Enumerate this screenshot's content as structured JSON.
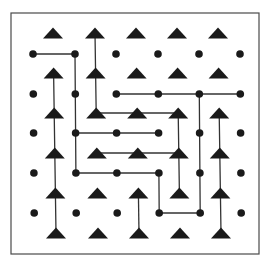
{
  "diagram": {
    "type": "dot-and-triangle lattice maze",
    "frame": {
      "x1": 11,
      "y1": 13,
      "x2": 259,
      "y2": 254,
      "color": "#4a4a4a"
    },
    "ink_color": "#1a1a1a",
    "line_color": "#333333",
    "triangle_grid": {
      "cols_x": [
        53,
        95,
        136,
        177,
        218
      ],
      "rows_y": [
        33,
        73,
        113,
        153,
        193,
        233
      ],
      "x_drift_per_row": 0.6
    },
    "dot_grid": {
      "cols_x": [
        33,
        75,
        116,
        158,
        199,
        240
      ],
      "rows_y": [
        54,
        94,
        133,
        173,
        213
      ],
      "x_drift_per_row": 0.3
    },
    "dot_paths": [
      [
        [
          0,
          0
        ],
        [
          1,
          0
        ],
        [
          1,
          1
        ],
        [
          1,
          2
        ],
        [
          1,
          3
        ],
        [
          2,
          3
        ],
        [
          3,
          3
        ],
        [
          3,
          4
        ],
        [
          4,
          4
        ],
        [
          4,
          3
        ],
        [
          4,
          2
        ],
        [
          4,
          1
        ]
      ],
      [
        [
          2,
          1
        ],
        [
          3,
          1
        ],
        [
          4,
          1
        ],
        [
          5,
          1
        ]
      ],
      [
        [
          1,
          2
        ],
        [
          2,
          2
        ],
        [
          3,
          2
        ]
      ]
    ],
    "triangle_paths": [
      [
        [
          0,
          1
        ],
        [
          0,
          2
        ],
        [
          0,
          3
        ],
        [
          0,
          4
        ],
        [
          0,
          5
        ]
      ],
      [
        [
          1,
          0
        ],
        [
          1,
          1
        ],
        [
          1,
          2
        ],
        [
          2,
          2
        ],
        [
          3,
          2
        ],
        [
          3,
          3
        ],
        [
          3,
          4
        ]
      ],
      [
        [
          1,
          3
        ],
        [
          2,
          3
        ],
        [
          3,
          3
        ]
      ],
      [
        [
          2,
          4
        ],
        [
          2,
          5
        ]
      ],
      [
        [
          4,
          2
        ],
        [
          4,
          3
        ],
        [
          4,
          4
        ],
        [
          4,
          5
        ]
      ]
    ],
    "counts": {
      "triangles": 30,
      "dots": 30
    }
  }
}
